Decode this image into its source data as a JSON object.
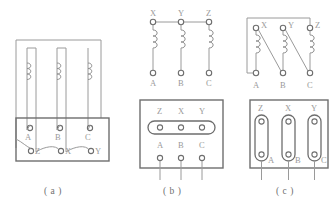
{
  "figure": {
    "background": "#ffffff",
    "line_color": "#8f8f8f",
    "box_color": "#6e6e6e",
    "label_color": "#9a9a9a",
    "caption_color": "#6f6f6f"
  },
  "captions": {
    "a": "( a )",
    "b": "( b )",
    "c": "( c )"
  },
  "panel_a": {
    "name": "stator-windings-with-terminal-box",
    "coil_count": 3,
    "terminal_box": {
      "top_row": [
        "A",
        "B",
        "C"
      ],
      "bottom_row": [
        "Z",
        "X",
        "Y"
      ]
    }
  },
  "panel_b": {
    "name": "star-wye-connection",
    "top_terminals": [
      "X",
      "Y",
      "Z"
    ],
    "bottom_terminals": [
      "A",
      "B",
      "C"
    ],
    "terminal_box": {
      "top_row": [
        "Z",
        "X",
        "Y"
      ],
      "bottom_row": [
        "A",
        "B",
        "C"
      ],
      "link_bars": 1,
      "link_orientation": "horizontal"
    },
    "lead_count": 3
  },
  "panel_c": {
    "name": "delta-connection",
    "top_terminals": [
      "X",
      "Y",
      "Z"
    ],
    "bottom_terminals": [
      "A",
      "B",
      "C"
    ],
    "terminal_box": {
      "top_row": [
        "Z",
        "X",
        "Y"
      ],
      "bottom_row": [
        "A",
        "B",
        "C"
      ],
      "link_bars": 3,
      "link_orientation": "vertical"
    },
    "lead_count": 3
  }
}
